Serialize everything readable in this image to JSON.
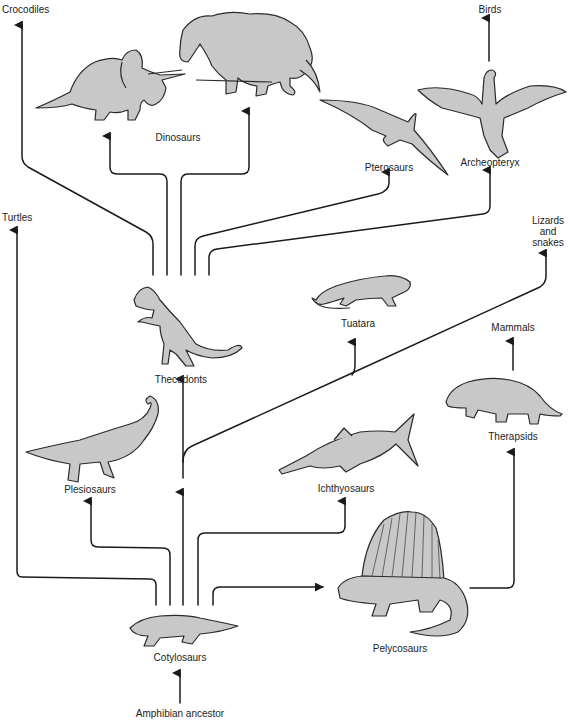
{
  "diagram": {
    "type": "evolutionary tree",
    "colors": {
      "line": "#1a1a1a",
      "animal_fill": "#c8c8c8",
      "animal_stroke": "#2a2a2a",
      "background": "#ffffff"
    },
    "nodes": {
      "amphibian_ancestor": {
        "label": "Amphibian ancestor"
      },
      "cotylosaurs": {
        "label": "Cotylosaurs"
      },
      "pelycosaurs": {
        "label": "Pelycosaurs"
      },
      "therapsids": {
        "label": "Therapsids"
      },
      "mammals": {
        "label": "Mammals"
      },
      "ichthyosaurs": {
        "label": "Ichthyosaurs"
      },
      "plesiosaurs": {
        "label": "Plesiosaurs"
      },
      "turtles": {
        "label": "Turtles"
      },
      "thecodonts": {
        "label": "Thecodonts"
      },
      "tuatara": {
        "label": "Tuatara"
      },
      "lizards_and_snakes": {
        "label": "Lizards\nand\nsnakes"
      },
      "crocodiles": {
        "label": "Crocodiles"
      },
      "dinosaurs": {
        "label": "Dinosaurs"
      },
      "pterosaurs": {
        "label": "Pterosaurs"
      },
      "archeopteryx": {
        "label": "Archeopteryx"
      },
      "birds": {
        "label": "Birds"
      }
    },
    "edges": [
      {
        "from": "Amphibian ancestor",
        "to": "Cotylosaurs"
      },
      {
        "from": "Cotylosaurs",
        "to": "Turtles"
      },
      {
        "from": "Cotylosaurs",
        "to": "Plesiosaurs"
      },
      {
        "from": "Cotylosaurs",
        "to": "Thecodonts"
      },
      {
        "from": "Cotylosaurs",
        "to": "Lizards and snakes"
      },
      {
        "from": "Cotylosaurs",
        "to": "Tuatara"
      },
      {
        "from": "Cotylosaurs",
        "to": "Ichthyosaurs"
      },
      {
        "from": "Cotylosaurs",
        "to": "Pelycosaurs"
      },
      {
        "from": "Pelycosaurs",
        "to": "Therapsids"
      },
      {
        "from": "Therapsids",
        "to": "Mammals"
      },
      {
        "from": "Thecodonts",
        "to": "Crocodiles"
      },
      {
        "from": "Thecodonts",
        "to": "Dinosaurs"
      },
      {
        "from": "Thecodonts",
        "to": "Dinosaurs"
      },
      {
        "from": "Thecodonts",
        "to": "Pterosaurs"
      },
      {
        "from": "Thecodonts",
        "to": "Archeopteryx"
      },
      {
        "from": "Archeopteryx",
        "to": "Birds"
      }
    ]
  }
}
